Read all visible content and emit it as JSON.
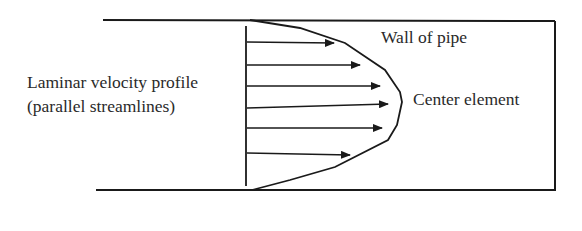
{
  "diagram": {
    "labels": {
      "profile_line1": "Laminar velocity profile",
      "profile_line2": "(parallel streamlines)",
      "wall": "Wall of pipe",
      "center": "Center element"
    },
    "colors": {
      "stroke": "#1a1a1a",
      "text": "#2a2a2a",
      "background": "#ffffff"
    },
    "arrows": [
      {
        "y": 42,
        "x_start": 247,
        "x_end": 334
      },
      {
        "y": 65,
        "x_start": 247,
        "x_end": 360
      },
      {
        "y": 86,
        "x_start": 247,
        "x_end": 380
      },
      {
        "y": 107,
        "x_start": 247,
        "x_end": 388
      },
      {
        "y": 128,
        "x_start": 247,
        "x_end": 382
      },
      {
        "y": 154,
        "x_start": 247,
        "x_end": 350
      }
    ]
  }
}
